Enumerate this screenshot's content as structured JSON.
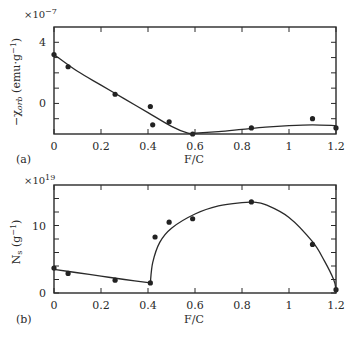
{
  "chart_data": [
    {
      "panel": "(a)",
      "type": "scatter",
      "title": "",
      "xlabel": "F/C",
      "ylabel": "−χ_orb (emu·g⁻¹)",
      "ylabel_main": "−χ",
      "ylabel_sub": "orb",
      "ylabel_unit": " (emu·g",
      "ylabel_sup": "−1",
      "ylabel_close": ")",
      "y_multiplier": "×10",
      "y_multiplier_exp": "−7",
      "xlim": [
        0,
        1.2
      ],
      "ylim": [
        -2,
        5
      ],
      "xticks": [
        0,
        0.2,
        0.4,
        0.6,
        0.8,
        1.0,
        1.2
      ],
      "xtick_labels": [
        "0",
        "0.2",
        "0.4",
        "0.6",
        "0.8",
        "1",
        "1.2"
      ],
      "yticks_major": [
        0,
        4
      ],
      "ytick_labels": [
        "0",
        "4"
      ],
      "yticks_minor": [
        -1,
        1,
        2,
        3
      ],
      "grid": false,
      "points": {
        "x": [
          0,
          0.06,
          0.26,
          0.41,
          0.42,
          0.49,
          0.59,
          0.84,
          1.1,
          1.2
        ],
        "y": [
          3.2,
          2.4,
          0.6,
          -0.2,
          -1.4,
          -1.2,
          -2.0,
          -1.6,
          -1.0,
          -1.6
        ]
      },
      "fit_curve": {
        "x": [
          0,
          0.1,
          0.2,
          0.3,
          0.4,
          0.5,
          0.57,
          0.6,
          0.7,
          0.8,
          0.9,
          1.0,
          1.1,
          1.2
        ],
        "y": [
          3.2,
          2.1,
          1.2,
          0.3,
          -0.6,
          -1.5,
          -1.95,
          -1.95,
          -1.85,
          -1.7,
          -1.55,
          -1.45,
          -1.4,
          -1.45
        ]
      }
    },
    {
      "panel": "(b)",
      "type": "scatter",
      "title": "",
      "xlabel": "F/C",
      "ylabel": "N_s (g⁻¹)",
      "ylabel_main": "N",
      "ylabel_sub": "s",
      "ylabel_unit": " (g",
      "ylabel_sup": "−1",
      "ylabel_close": ")",
      "y_multiplier": "×10",
      "y_multiplier_exp": "19",
      "xlim": [
        0,
        1.2
      ],
      "ylim": [
        0,
        16
      ],
      "xticks": [
        0,
        0.2,
        0.4,
        0.6,
        0.8,
        1.0,
        1.2
      ],
      "xtick_labels": [
        "0",
        "0.2",
        "0.4",
        "0.6",
        "0.8",
        "1",
        "1.2"
      ],
      "yticks_major": [
        0,
        10
      ],
      "ytick_labels": [
        "0",
        "10"
      ],
      "yticks_minor": [
        2,
        4,
        6,
        8,
        12,
        14
      ],
      "grid": false,
      "points": {
        "x": [
          0,
          0.06,
          0.26,
          0.41,
          0.43,
          0.49,
          0.59,
          0.84,
          1.1,
          1.2
        ],
        "y": [
          3.7,
          2.9,
          1.9,
          1.5,
          8.3,
          10.5,
          11.0,
          13.5,
          7.2,
          0.5
        ]
      },
      "fit_curves": [
        {
          "x": [
            0,
            0.1,
            0.2,
            0.3,
            0.41
          ],
          "y": [
            3.5,
            3.0,
            2.5,
            2.0,
            1.5
          ]
        },
        {
          "x": [
            0.41,
            0.42,
            0.45,
            0.5,
            0.6,
            0.7,
            0.8,
            0.85,
            0.9,
            1.0,
            1.1,
            1.15,
            1.19,
            1.2
          ],
          "y": [
            1.5,
            4.5,
            7.5,
            9.6,
            11.7,
            12.9,
            13.4,
            13.45,
            13.1,
            11.2,
            7.6,
            4.8,
            2.0,
            0.5
          ]
        }
      ]
    }
  ]
}
